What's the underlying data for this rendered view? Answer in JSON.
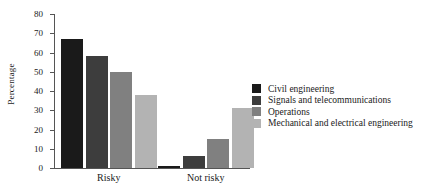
{
  "chart_data": {
    "type": "bar",
    "title": "",
    "xlabel": "",
    "ylabel": "Percentage",
    "ylim": [
      0,
      80
    ],
    "yticks": [
      0,
      10,
      20,
      30,
      40,
      50,
      60,
      70,
      80
    ],
    "grid": false,
    "legend_position": "right",
    "categories": [
      "Risky",
      "Not risky"
    ],
    "series": [
      {
        "name": "Civil engineering",
        "color": "#1a1a1a",
        "values": [
          67,
          1
        ]
      },
      {
        "name": "Signals and telecommunications",
        "color": "#3d3d3d",
        "values": [
          58,
          6
        ]
      },
      {
        "name": "Operations",
        "color": "#808080",
        "values": [
          50,
          15
        ]
      },
      {
        "name": "Mechanical and electrical engineering",
        "color": "#b3b3b3",
        "values": [
          38,
          31
        ]
      }
    ]
  }
}
